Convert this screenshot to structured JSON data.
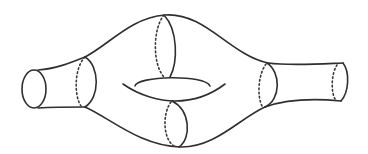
{
  "figure": {
    "stroke_color": "#2f2f2f",
    "background": "#ffffff",
    "components": {
      "left_end_cap": "ellipse",
      "left_neck_ring": "cross-section circle (solid front, dotted back)",
      "top_ring": "cross-section circle (solid front, dotted back)",
      "bottom_ring": "cross-section circle (solid front, dotted back)",
      "handle_hole": "central genus hole",
      "right_neck_ring": "cross-section circle (solid front, dotted back)",
      "right_end_cap": "cross-section circle (solid front, dotted back)"
    }
  }
}
